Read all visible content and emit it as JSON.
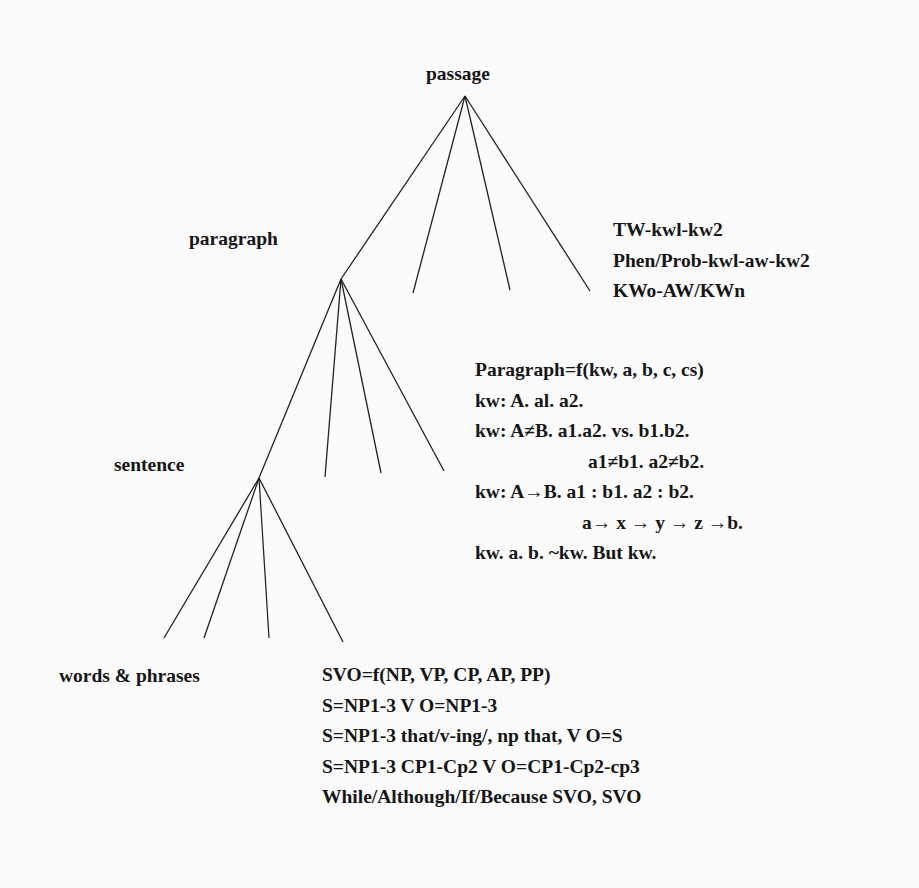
{
  "tree": {
    "levels": {
      "passage": "passage",
      "paragraph": "paragraph",
      "sentence": "sentence",
      "words": "words & phrases"
    },
    "line_color": "#222222"
  },
  "passage_notes": [
    "TW-kwl-kw2",
    "Phen/Prob-kwl-aw-kw2",
    "KWo-AW/KWn"
  ],
  "paragraph_notes": [
    "Paragraph=f(kw, a, b, c, cs)",
    "kw: A. al. a2.",
    "kw: A≠B. a1.a2. vs. b1.b2.",
    "a1≠b1. a2≠b2.",
    "kw: A→B. a1 : b1. a2 : b2.",
    "a→ x → y → z →b.",
    "kw. a. b. ~kw. But kw."
  ],
  "sentence_notes": [
    "SVO=f(NP, VP, CP, AP, PP)",
    "S=NP1-3 V O=NP1-3",
    "S=NP1-3 that/v-ing/, np that, V O=S",
    "S=NP1-3 CP1-Cp2 V O=CP1-Cp2-cp3",
    "While/Although/If/Because SVO, SVO"
  ]
}
